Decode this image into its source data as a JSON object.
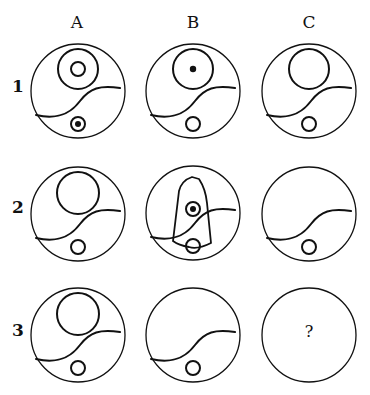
{
  "puzzle": {
    "columns": [
      {
        "label": "A",
        "x": 62
      },
      {
        "label": "B",
        "x": 178
      },
      {
        "label": "C",
        "x": 294
      }
    ],
    "rows": [
      {
        "label": "1",
        "y": 76
      },
      {
        "label": "2",
        "y": 197
      },
      {
        "label": "3",
        "y": 320
      }
    ],
    "question_mark": "?",
    "stroke_color": "#111111",
    "cells": [
      {
        "id": "A1",
        "cx": 78,
        "cy": 91,
        "big_circle": true,
        "inner": "ring",
        "small": "ring-dot"
      },
      {
        "id": "B1",
        "cx": 193,
        "cy": 91,
        "big_circle": true,
        "inner": "dot",
        "small": "ring"
      },
      {
        "id": "C1",
        "cx": 309,
        "cy": 91,
        "big_circle": true,
        "inner": "none",
        "small": "ring"
      },
      {
        "id": "A2",
        "cx": 78,
        "cy": 214,
        "big_circle": true,
        "inner": "none",
        "small": "ring"
      },
      {
        "id": "B2",
        "cx": 193,
        "cy": 213,
        "big_circle": false,
        "bullet_shape": true,
        "inner": "ring-dot",
        "small": "ring"
      },
      {
        "id": "C2",
        "cx": 309,
        "cy": 214,
        "big_circle": false,
        "inner": "none",
        "small": "ring"
      },
      {
        "id": "A3",
        "cx": 78,
        "cy": 335,
        "big_circle": true,
        "inner": "none",
        "small": "ring"
      },
      {
        "id": "B3",
        "cx": 193,
        "cy": 335,
        "big_circle": false,
        "inner": "none",
        "small": "ring"
      },
      {
        "id": "C3",
        "cx": 309,
        "cy": 335,
        "unknown": true
      }
    ]
  }
}
